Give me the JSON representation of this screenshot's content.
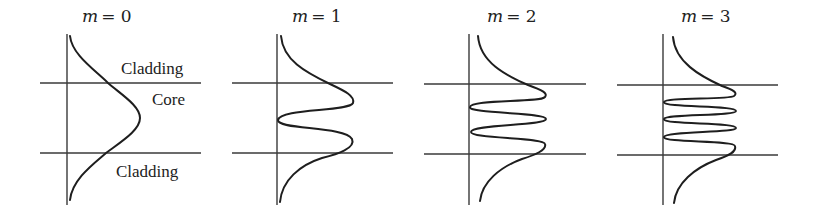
{
  "figure": {
    "boundary_y": {
      "upper": 83,
      "lower": 153
    },
    "panels": [
      {
        "mode_symbol": "m",
        "mode_eq": "= 0",
        "mode_index": 0,
        "axis_x": 67,
        "line_x1": 40,
        "line_x2": 200,
        "title_x": 82
      },
      {
        "mode_symbol": "m",
        "mode_eq": "= 1",
        "mode_index": 1,
        "axis_x": 277,
        "line_x1": 232,
        "line_x2": 393,
        "title_x": 292
      },
      {
        "mode_symbol": "m",
        "mode_eq": "= 2",
        "mode_index": 2,
        "axis_x": 469,
        "line_x1": 424,
        "line_x2": 586,
        "title_x": 487
      },
      {
        "mode_symbol": "m",
        "mode_eq": "= 3",
        "mode_index": 3,
        "axis_x": 663,
        "line_x1": 617,
        "line_x2": 778,
        "title_x": 681
      }
    ],
    "region_labels": {
      "cladding_top": "Cladding",
      "core": "Core",
      "cladding_bottom": "Cladding"
    },
    "colors": {
      "line": "#2a2a2a",
      "curve": "#1e1e1e",
      "background": "#ffffff"
    }
  }
}
